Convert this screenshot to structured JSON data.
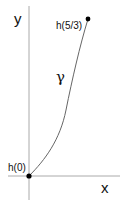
{
  "diagram": {
    "axes": {
      "x_label": "x",
      "y_label": "y"
    },
    "curve": {
      "label": "γ"
    },
    "points": [
      {
        "label": "h(0)",
        "role": "start"
      },
      {
        "label": "h(5/3)",
        "role": "end"
      }
    ],
    "colors": {
      "axis": "#aaaaaa",
      "curve": "#666666",
      "point": "#000000",
      "text": "#111111"
    }
  }
}
